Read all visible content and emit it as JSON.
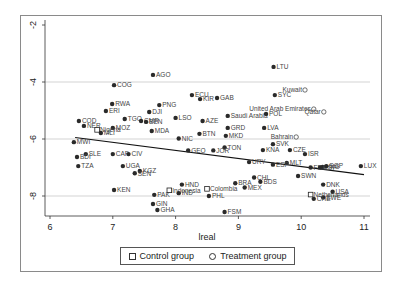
{
  "chart_data": {
    "type": "scatter",
    "title": "",
    "xlabel": "lreal",
    "ylabel": "",
    "xlim": [
      5.95,
      11.1
    ],
    "ylim": [
      -8.9,
      -1.9
    ],
    "x_ticks": [
      6,
      7,
      8,
      9,
      10,
      11
    ],
    "y_ticks": [
      -2,
      -4,
      -6,
      -8
    ],
    "grid": "horizontal",
    "legend_position": "bottom",
    "legend": [
      {
        "name": "Control group",
        "marker": "square"
      },
      {
        "name": "Treatment group",
        "marker": "circle"
      }
    ],
    "fit_line": {
      "x": [
        6.4,
        11.0
      ],
      "y": [
        -5.95,
        -7.25
      ]
    },
    "points": [
      {
        "label": "LTU",
        "x": 9.56,
        "y": -3.47,
        "group": "none"
      },
      {
        "label": "AGO",
        "x": 7.64,
        "y": -3.75,
        "group": "none"
      },
      {
        "label": "COG",
        "x": 7.02,
        "y": -4.11,
        "group": "none"
      },
      {
        "label": "ECU",
        "x": 8.26,
        "y": -4.46,
        "group": "none"
      },
      {
        "label": "KIR",
        "x": 8.39,
        "y": -4.6,
        "group": "none"
      },
      {
        "label": "GAB",
        "x": 8.66,
        "y": -4.56,
        "group": "none"
      },
      {
        "label": "Kuwait",
        "x": 10.06,
        "y": -4.28,
        "group": "treatment"
      },
      {
        "label": "SYC",
        "x": 9.58,
        "y": -4.46,
        "group": "none"
      },
      {
        "label": "RWA",
        "x": 6.99,
        "y": -4.77,
        "group": "none"
      },
      {
        "label": "PNG",
        "x": 7.74,
        "y": -4.81,
        "group": "none"
      },
      {
        "label": "ERI",
        "x": 6.89,
        "y": -5.02,
        "group": "none"
      },
      {
        "label": "DJI",
        "x": 7.58,
        "y": -5.05,
        "group": "none"
      },
      {
        "label": "United Arab Emirates",
        "x": 10.2,
        "y": -4.95,
        "group": "treatment"
      },
      {
        "label": "Qatar",
        "x": 10.36,
        "y": -5.05,
        "group": "treatment"
      },
      {
        "label": "Saudi Arabia",
        "x": 8.83,
        "y": -5.19,
        "group": "none"
      },
      {
        "label": "POL",
        "x": 9.44,
        "y": -5.12,
        "group": "none"
      },
      {
        "label": "LSO",
        "x": 8.0,
        "y": -5.26,
        "group": "none"
      },
      {
        "label": "AZE",
        "x": 8.43,
        "y": -5.37,
        "group": "none"
      },
      {
        "label": "COD",
        "x": 6.46,
        "y": -5.37,
        "group": "none"
      },
      {
        "label": "TGO",
        "x": 7.19,
        "y": -5.3,
        "group": "none"
      },
      {
        "label": "CMR",
        "x": 7.45,
        "y": -5.37,
        "group": "none"
      },
      {
        "label": "BEN",
        "x": 7.53,
        "y": -5.4,
        "group": "none"
      },
      {
        "label": "NER",
        "x": 6.54,
        "y": -5.54,
        "group": "none"
      },
      {
        "label": "MOZ",
        "x": 7.0,
        "y": -5.61,
        "group": "none"
      },
      {
        "label": "Nigeria",
        "x": 6.75,
        "y": -5.68,
        "group": "control"
      },
      {
        "label": "MLI",
        "x": 6.81,
        "y": -5.79,
        "group": "none"
      },
      {
        "label": "MDA",
        "x": 7.62,
        "y": -5.72,
        "group": "none"
      },
      {
        "label": "GRD",
        "x": 8.83,
        "y": -5.61,
        "group": "none"
      },
      {
        "label": "LVA",
        "x": 9.41,
        "y": -5.61,
        "group": "none"
      },
      {
        "label": "BTN",
        "x": 8.38,
        "y": -5.82,
        "group": "none"
      },
      {
        "label": "MKD",
        "x": 8.8,
        "y": -5.89,
        "group": "none"
      },
      {
        "label": "Bahrain",
        "x": 9.92,
        "y": -5.93,
        "group": "treatment"
      },
      {
        "label": "NIC",
        "x": 8.05,
        "y": -5.98,
        "group": "none"
      },
      {
        "label": "MWI",
        "x": 6.38,
        "y": -6.11,
        "group": "none"
      },
      {
        "label": "SVK",
        "x": 9.55,
        "y": -6.18,
        "group": "none"
      },
      {
        "label": "KNA",
        "x": 9.39,
        "y": -6.39,
        "group": "none"
      },
      {
        "label": "CZE",
        "x": 9.82,
        "y": -6.39,
        "group": "none"
      },
      {
        "label": "ISR",
        "x": 10.06,
        "y": -6.53,
        "group": "none"
      },
      {
        "label": "TON",
        "x": 8.78,
        "y": -6.3,
        "group": "none"
      },
      {
        "label": "JOR",
        "x": 8.6,
        "y": -6.4,
        "group": "none"
      },
      {
        "label": "GEO",
        "x": 8.2,
        "y": -6.4,
        "group": "none"
      },
      {
        "label": "MLT",
        "x": 9.77,
        "y": -6.84,
        "group": "none"
      },
      {
        "label": "LUX",
        "x": 10.95,
        "y": -6.95,
        "group": "none"
      },
      {
        "label": "HKG",
        "x": 10.34,
        "y": -6.98,
        "group": "none"
      },
      {
        "label": "URY",
        "x": 9.17,
        "y": -6.81,
        "group": "none"
      },
      {
        "label": "ESP",
        "x": 9.55,
        "y": -6.9,
        "group": "none"
      },
      {
        "label": "SLE",
        "x": 6.57,
        "y": -6.53,
        "group": "none"
      },
      {
        "label": "BDI",
        "x": 6.43,
        "y": -6.63,
        "group": "none"
      },
      {
        "label": "TZA",
        "x": 6.45,
        "y": -6.95,
        "group": "none"
      },
      {
        "label": "CAF",
        "x": 7.0,
        "y": -6.53,
        "group": "none"
      },
      {
        "label": "CIV",
        "x": 7.25,
        "y": -6.53,
        "group": "none"
      },
      {
        "label": "UGA",
        "x": 7.16,
        "y": -6.95,
        "group": "none"
      },
      {
        "label": "KGZ",
        "x": 7.43,
        "y": -7.12,
        "group": "none"
      },
      {
        "label": "SEN",
        "x": 7.35,
        "y": -7.2,
        "group": "none"
      },
      {
        "label": "KEN",
        "x": 7.02,
        "y": -7.79,
        "group": "none"
      },
      {
        "label": "PAK",
        "x": 7.66,
        "y": -7.96,
        "group": "none"
      },
      {
        "label": "Indonesia",
        "x": 7.9,
        "y": -7.8,
        "group": "control"
      },
      {
        "label": "IND",
        "x": 8.05,
        "y": -7.9,
        "group": "none"
      },
      {
        "label": "HND",
        "x": 8.1,
        "y": -7.6,
        "group": "none"
      },
      {
        "label": "Colombia",
        "x": 8.5,
        "y": -7.75,
        "group": "control"
      },
      {
        "label": "PHL",
        "x": 8.53,
        "y": -8.0,
        "group": "none"
      },
      {
        "label": "GIN",
        "x": 7.64,
        "y": -8.28,
        "group": "none"
      },
      {
        "label": "GHA",
        "x": 7.71,
        "y": -8.49,
        "group": "none"
      },
      {
        "label": "FSM",
        "x": 8.78,
        "y": -8.56,
        "group": "none"
      },
      {
        "label": "BRA",
        "x": 8.95,
        "y": -7.55,
        "group": "none"
      },
      {
        "label": "MEX",
        "x": 9.1,
        "y": -7.7,
        "group": "none"
      },
      {
        "label": "CHL",
        "x": 9.25,
        "y": -7.35,
        "group": "none"
      },
      {
        "label": "BDS",
        "x": 9.35,
        "y": -7.5,
        "group": "none"
      },
      {
        "label": "FRA",
        "x": 10.15,
        "y": -7.0,
        "group": "none"
      },
      {
        "label": "EGP",
        "x": 10.3,
        "y": -7.0,
        "group": "none"
      },
      {
        "label": "SGP",
        "x": 10.4,
        "y": -6.95,
        "group": "none"
      },
      {
        "label": "SWN",
        "x": 9.95,
        "y": -7.3,
        "group": "none"
      },
      {
        "label": "DNK",
        "x": 10.35,
        "y": -7.6,
        "group": "none"
      },
      {
        "label": "USA",
        "x": 10.5,
        "y": -7.85,
        "group": "none"
      },
      {
        "label": "Netherlands",
        "x": 10.15,
        "y": -7.95,
        "group": "control"
      },
      {
        "label": "SWE",
        "x": 10.35,
        "y": -8.05,
        "group": "none"
      },
      {
        "label": "CHE",
        "x": 10.2,
        "y": -8.1,
        "group": "none"
      }
    ]
  },
  "axis": {
    "x_title": "lreal",
    "x_ticks": [
      "6",
      "7",
      "8",
      "9",
      "10",
      "11"
    ],
    "y_ticks": [
      "-2",
      "-4",
      "-6",
      "-8"
    ]
  },
  "legend": {
    "control": "Control group",
    "treatment": "Treatment group"
  },
  "colors": {
    "marker": "#2a2a2a",
    "grid": "#c8c8c8",
    "label": "#444444",
    "frame": "#8a8a8a"
  }
}
